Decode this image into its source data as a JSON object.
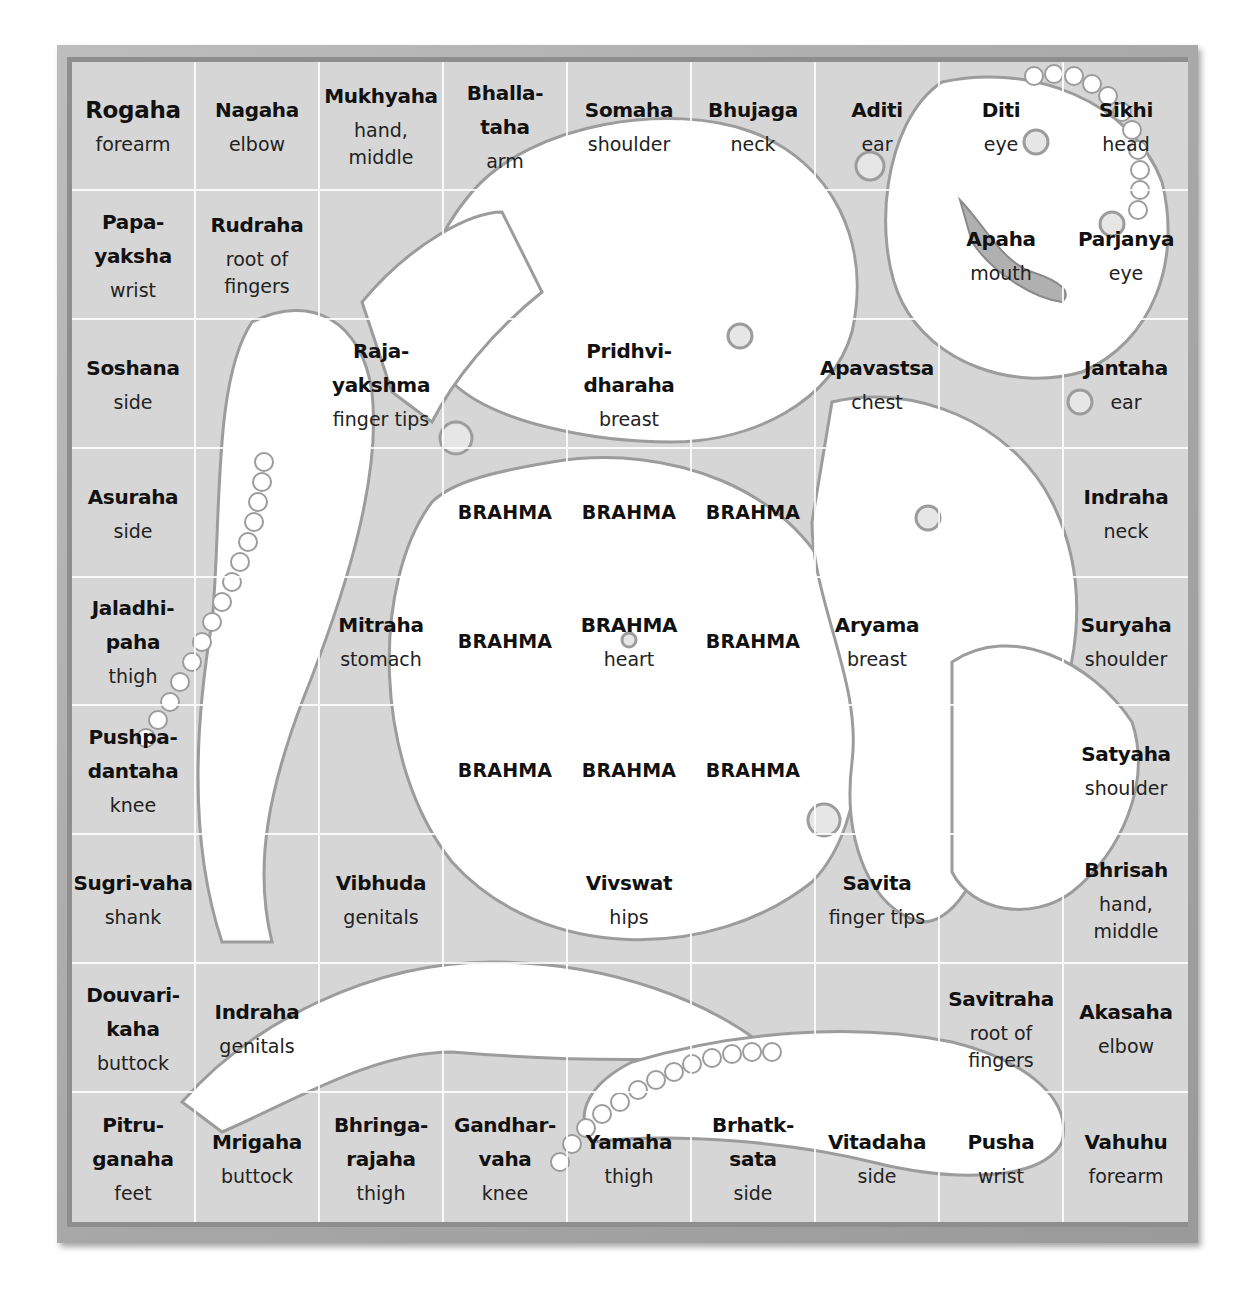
{
  "colors": {
    "frame": "#a8a8a8",
    "board": "#d6d6d6",
    "figure": "#ffffff",
    "outline": "#9c9c9c",
    "grid_line": "#ffffff"
  },
  "grid": {
    "rows": 9,
    "cols": 9,
    "cells": [
      [
        {
          "deity": "Rogaha",
          "part": "forearm"
        },
        {
          "deity": "Nagaha",
          "part": "elbow"
        },
        {
          "deity": "Mukhyaha",
          "part": "hand, middle"
        },
        {
          "deity": "Bhalla-taha",
          "part": "arm"
        },
        {
          "deity": "Somaha",
          "part": "shoulder"
        },
        {
          "deity": "Bhujaga",
          "part": "neck"
        },
        {
          "deity": "Aditi",
          "part": "ear"
        },
        {
          "deity": "Diti",
          "part": "eye"
        },
        {
          "deity": "Sikhi",
          "part": "head"
        }
      ],
      [
        {
          "deity": "Papa-\nyaksha",
          "part": "wrist"
        },
        {
          "deity": "Rudraha",
          "part": "root of\nfingers"
        },
        {
          "deity": "",
          "part": ""
        },
        {
          "deity": "",
          "part": ""
        },
        {
          "deity": "",
          "part": ""
        },
        {
          "deity": "",
          "part": ""
        },
        {
          "deity": "",
          "part": ""
        },
        {
          "deity": "Apaha",
          "part": "mouth"
        },
        {
          "deity": "Parjanya",
          "part": "eye"
        }
      ],
      [
        {
          "deity": "Soshana",
          "part": "side"
        },
        {
          "deity": "",
          "part": ""
        },
        {
          "deity": "Raja-\nyakshma",
          "part": "finger tips"
        },
        {
          "deity": "",
          "part": ""
        },
        {
          "deity": "Pridhvi-\ndharaha",
          "part": "breast"
        },
        {
          "deity": "",
          "part": ""
        },
        {
          "deity": "Apavastsa",
          "part": "chest"
        },
        {
          "deity": "",
          "part": ""
        },
        {
          "deity": "Jantaha",
          "part": "ear"
        }
      ],
      [
        {
          "deity": "Asuraha",
          "part": "side"
        },
        {
          "deity": "",
          "part": ""
        },
        {
          "deity": "",
          "part": ""
        },
        {
          "brahma": "BRAHMA"
        },
        {
          "brahma": "BRAHMA"
        },
        {
          "brahma": "BRAHMA"
        },
        {
          "deity": "",
          "part": ""
        },
        {
          "deity": "",
          "part": ""
        },
        {
          "deity": "Indraha",
          "part": "neck"
        }
      ],
      [
        {
          "deity": "Jaladhi-\npaha",
          "part": "thigh"
        },
        {
          "deity": "",
          "part": ""
        },
        {
          "deity": "Mitraha",
          "part": "stomach"
        },
        {
          "brahma": "BRAHMA"
        },
        {
          "deity": "BRAHMA",
          "part": "heart"
        },
        {
          "brahma": "BRAHMA"
        },
        {
          "deity": "Aryama",
          "part": "breast"
        },
        {
          "deity": "",
          "part": ""
        },
        {
          "deity": "Suryaha",
          "part": "shoulder"
        }
      ],
      [
        {
          "deity": "Pushpa-\ndantaha",
          "part": "knee"
        },
        {
          "deity": "",
          "part": ""
        },
        {
          "deity": "",
          "part": ""
        },
        {
          "brahma": "BRAHMA"
        },
        {
          "brahma": "BRAHMA"
        },
        {
          "brahma": "BRAHMA"
        },
        {
          "deity": "",
          "part": ""
        },
        {
          "deity": "",
          "part": ""
        },
        {
          "deity": "Satyaha",
          "part": "shoulder"
        }
      ],
      [
        {
          "deity": "Sugri-vaha",
          "part": "shank"
        },
        {
          "deity": "",
          "part": ""
        },
        {
          "deity": "Vibhuda",
          "part": "genitals"
        },
        {
          "deity": "",
          "part": ""
        },
        {
          "deity": "Vivswat",
          "part": "hips"
        },
        {
          "deity": "",
          "part": ""
        },
        {
          "deity": "Savita",
          "part": "finger tips"
        },
        {
          "deity": "",
          "part": ""
        },
        {
          "deity": "Bhrisah",
          "part": "hand, middle"
        }
      ],
      [
        {
          "deity": "Douvari-\nkaha",
          "part": "buttock"
        },
        {
          "deity": "Indraha",
          "part": "genitals"
        },
        {
          "deity": "",
          "part": ""
        },
        {
          "deity": "",
          "part": ""
        },
        {
          "deity": "",
          "part": ""
        },
        {
          "deity": "",
          "part": ""
        },
        {
          "deity": "",
          "part": ""
        },
        {
          "deity": "Savitraha",
          "part": "root of\nfingers"
        },
        {
          "deity": "Akasaha",
          "part": "elbow"
        }
      ],
      [
        {
          "deity": "Pitru-\nganaha",
          "part": "feet"
        },
        {
          "deity": "Mrigaha",
          "part": "buttock"
        },
        {
          "deity": "Bhringa-\nrajaha",
          "part": "thigh"
        },
        {
          "deity": "Gandhar-\nvaha",
          "part": "knee"
        },
        {
          "deity": "Yamaha",
          "part": "thigh"
        },
        {
          "deity": "Brhatk-sata",
          "part": "side"
        },
        {
          "deity": "Vitadaha",
          "part": "side"
        },
        {
          "deity": "Pusha",
          "part": "wrist"
        },
        {
          "deity": "Vahuhu",
          "part": "forearm"
        }
      ]
    ]
  }
}
